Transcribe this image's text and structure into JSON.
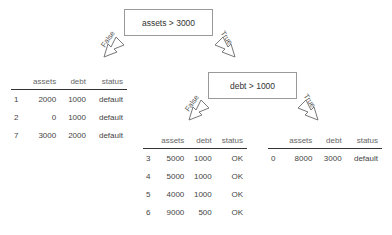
{
  "tree": {
    "root": {
      "condition": "assets > 3000"
    },
    "child": {
      "condition": "debt > 1000"
    },
    "edges": {
      "false_label": "False",
      "true_label": "True"
    }
  },
  "tables": {
    "columns": [
      "",
      "assets",
      "debt",
      "status"
    ],
    "left": [
      [
        "1",
        "2000",
        "1000",
        "default"
      ],
      [
        "2",
        "0",
        "1000",
        "default"
      ],
      [
        "7",
        "3000",
        "2000",
        "default"
      ]
    ],
    "middle": [
      [
        "3",
        "5000",
        "1000",
        "OK"
      ],
      [
        "4",
        "5000",
        "1000",
        "OK"
      ],
      [
        "5",
        "4000",
        "1000",
        "OK"
      ],
      [
        "6",
        "9000",
        "500",
        "OK"
      ]
    ],
    "right": [
      [
        "0",
        "8000",
        "3000",
        "default"
      ]
    ]
  },
  "colors": {
    "border": "#999999",
    "text": "#444444",
    "rule": "#333333"
  }
}
